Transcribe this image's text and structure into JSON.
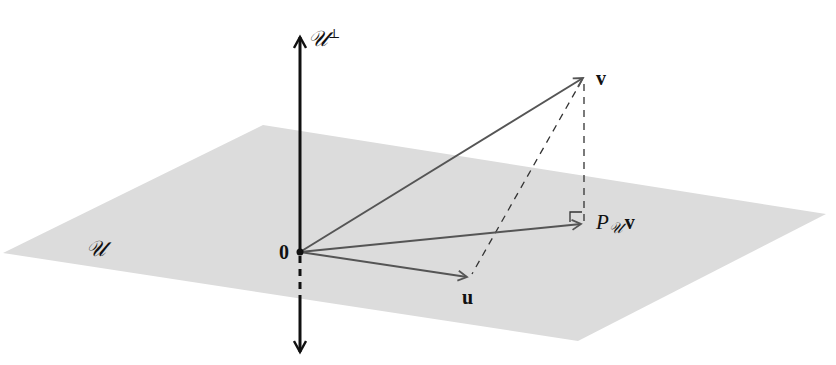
{
  "diagram": {
    "type": "orthogonal-projection",
    "colors": {
      "plane": "#dcdcdc",
      "vector": "#555555",
      "axis": "#111111",
      "dashed": "#333333"
    },
    "plane_label": "𝒰",
    "axis": {
      "label_main": "𝒰",
      "label_sup": "⊥"
    },
    "origin_label": "0",
    "vectors": [
      {
        "id": "v",
        "label": "v"
      },
      {
        "id": "proj",
        "label_main": "P",
        "label_sub": "𝒰",
        "label_tail": "v"
      },
      {
        "id": "u",
        "label": "u"
      }
    ]
  }
}
